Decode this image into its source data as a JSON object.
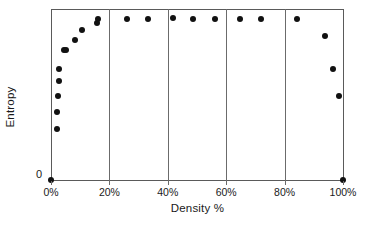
{
  "chart_data": {
    "type": "scatter",
    "title": "",
    "xlabel": "Density %",
    "ylabel": "Entropy",
    "xlim": [
      0,
      100
    ],
    "ylim": [
      0,
      1
    ],
    "grid": true,
    "legend": null,
    "x_tick_labels": [
      "0%",
      "20%",
      "40%",
      "60%",
      "80%",
      "100%"
    ],
    "x_tick_values": [
      0,
      20,
      40,
      60,
      80,
      100
    ],
    "y_tick_labels": [
      "0"
    ],
    "y_tick_values": [
      0
    ],
    "marker": "filled-circle",
    "marker_color": "#111111",
    "gridline_values": [
      20,
      40,
      60,
      80
    ],
    "points": [
      {
        "x": 0,
        "y": 0.0
      },
      {
        "x": 2.0,
        "y": 0.3
      },
      {
        "x": 2.0,
        "y": 0.4
      },
      {
        "x": 2.4,
        "y": 0.49
      },
      {
        "x": 2.7,
        "y": 0.58
      },
      {
        "x": 2.7,
        "y": 0.65
      },
      {
        "x": 4.4,
        "y": 0.76
      },
      {
        "x": 5.1,
        "y": 0.76
      },
      {
        "x": 8.2,
        "y": 0.82
      },
      {
        "x": 10.6,
        "y": 0.88
      },
      {
        "x": 15.7,
        "y": 0.92
      },
      {
        "x": 16.0,
        "y": 0.94
      },
      {
        "x": 26.0,
        "y": 0.94
      },
      {
        "x": 33.1,
        "y": 0.94
      },
      {
        "x": 41.6,
        "y": 0.95
      },
      {
        "x": 48.5,
        "y": 0.94
      },
      {
        "x": 56.3,
        "y": 0.94
      },
      {
        "x": 64.8,
        "y": 0.94
      },
      {
        "x": 72.0,
        "y": 0.94
      },
      {
        "x": 84.3,
        "y": 0.94
      },
      {
        "x": 93.9,
        "y": 0.84
      },
      {
        "x": 96.6,
        "y": 0.65
      },
      {
        "x": 98.6,
        "y": 0.49
      },
      {
        "x": 100,
        "y": 0.0
      }
    ]
  },
  "colors": {
    "marker": "#111111",
    "axis": "#5a5a5a",
    "grid": "#6b6b6b",
    "text": "#1a1a1a",
    "background": "#ffffff"
  }
}
